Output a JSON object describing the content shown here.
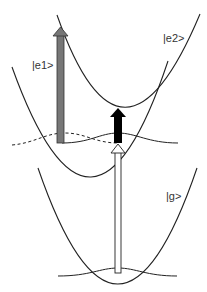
{
  "diagram": {
    "type": "potential-energy-curves",
    "states": [
      {
        "id": "g",
        "label": "|g>"
      },
      {
        "id": "e1",
        "label": "|e1>"
      },
      {
        "id": "e2",
        "label": "|e2>"
      }
    ],
    "arrows": [
      {
        "id": "pump",
        "description": "white arrow from |g> to |e1>",
        "fill": "#ffffff"
      },
      {
        "id": "probe-e2",
        "description": "black arrow from |e1> to |e2>",
        "fill": "#000000"
      },
      {
        "id": "probe-high",
        "description": "gray tall arrow from |e1> upward",
        "fill": "#777777"
      }
    ],
    "colors": {
      "curve": "#222222",
      "gray_arrow": "#777777",
      "black_arrow": "#000000",
      "white_arrow": "#ffffff"
    }
  }
}
